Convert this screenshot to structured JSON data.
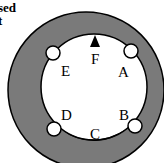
{
  "caption": {
    "line1": "sed",
    "line2": "t"
  },
  "diagram": {
    "outer_fill": "#7a7a7a",
    "inner_fill": "#ffffff",
    "stroke": "#000000",
    "labels": {
      "A": "A",
      "B": "B",
      "C": "C",
      "D": "D",
      "E": "E",
      "F": "F"
    }
  }
}
